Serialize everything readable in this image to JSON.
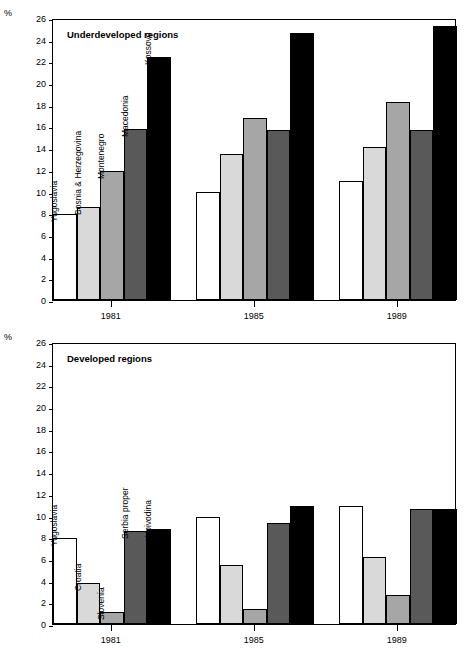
{
  "figure": {
    "unit_label": "%",
    "panels": [
      {
        "id": "underdeveloped",
        "title": "Underdeveloped regions",
        "series_labels": [
          "Yugoslavia",
          "Bosnia & Herzegovina",
          "Montenegro",
          "Macedonia",
          "Kossovo"
        ],
        "x_labels": [
          "1981",
          "1985",
          "1989"
        ]
      },
      {
        "id": "developed",
        "title": "Developed regions",
        "series_labels": [
          "Yugoslavia",
          "Croatia",
          "Slovenia",
          "Serbia proper",
          "Voivodina"
        ],
        "x_labels": [
          "1981",
          "1985",
          "1989"
        ]
      }
    ]
  },
  "colors": {
    "white": "#ffffff",
    "light_grey": "#d9d9d9",
    "mid_grey": "#a6a6a6",
    "dark_grey": "#595959",
    "black": "#000000",
    "axis": "#000000"
  },
  "y_ticks": [
    0,
    2,
    4,
    6,
    8,
    10,
    12,
    14,
    16,
    18,
    20,
    22,
    24,
    26
  ],
  "chart_data": [
    {
      "type": "bar",
      "title": "Underdeveloped regions",
      "xlabel": "",
      "ylabel": "%",
      "ylim": [
        0,
        26
      ],
      "ytick_step": 2,
      "grid": false,
      "legend": "in-bar rotated labels (first group)",
      "categories": [
        "1981",
        "1985",
        "1989"
      ],
      "series": [
        {
          "name": "Yugoslavia",
          "color": "#ffffff",
          "values": [
            7.9,
            10.0,
            11.0
          ]
        },
        {
          "name": "Bosnia & Herzegovina",
          "color": "#d9d9d9",
          "values": [
            8.6,
            13.5,
            14.1
          ]
        },
        {
          "name": "Montenegro",
          "color": "#a6a6a6",
          "values": [
            11.9,
            16.8,
            18.3
          ]
        },
        {
          "name": "Macedonia",
          "color": "#595959",
          "values": [
            15.8,
            15.7,
            15.7
          ]
        },
        {
          "name": "Kossovo",
          "color": "#000000",
          "values": [
            22.4,
            24.6,
            25.3
          ]
        }
      ]
    },
    {
      "type": "bar",
      "title": "Developed regions",
      "xlabel": "",
      "ylabel": "%",
      "ylim": [
        0,
        26
      ],
      "ytick_step": 2,
      "grid": false,
      "legend": "in-bar rotated labels (first group)",
      "categories": [
        "1981",
        "1985",
        "1989"
      ],
      "series": [
        {
          "name": "Yugoslavia",
          "color": "#ffffff",
          "values": [
            7.9,
            9.9,
            10.9
          ]
        },
        {
          "name": "Croatia",
          "color": "#d9d9d9",
          "values": [
            3.8,
            5.4,
            6.2
          ]
        },
        {
          "name": "Slovenia",
          "color": "#a6a6a6",
          "values": [
            1.1,
            1.4,
            2.7
          ]
        },
        {
          "name": "Serbia proper",
          "color": "#595959",
          "values": [
            8.6,
            9.3,
            10.6
          ]
        },
        {
          "name": "Voivodina",
          "color": "#000000",
          "values": [
            8.8,
            10.9,
            10.6
          ]
        }
      ]
    }
  ]
}
